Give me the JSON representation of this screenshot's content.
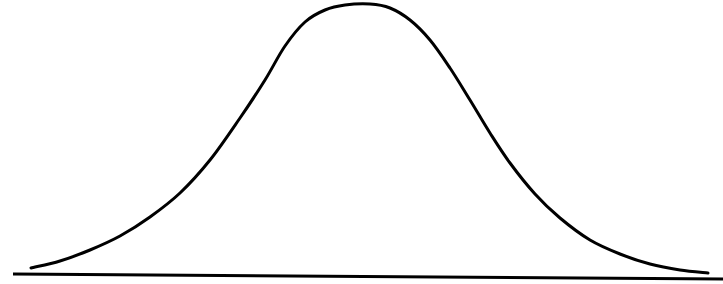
{
  "diagram": {
    "type": "normal-distribution-curve",
    "background": "#ffffff",
    "stroke_color": "#000000",
    "curve": {
      "stroke_width": 3,
      "points": [
        [
          31,
          268
        ],
        [
          60,
          261
        ],
        [
          90,
          250
        ],
        [
          120,
          236
        ],
        [
          150,
          217
        ],
        [
          180,
          193
        ],
        [
          210,
          160
        ],
        [
          240,
          118
        ],
        [
          265,
          80
        ],
        [
          285,
          46
        ],
        [
          305,
          22
        ],
        [
          325,
          10
        ],
        [
          345,
          5
        ],
        [
          370,
          4
        ],
        [
          390,
          8
        ],
        [
          410,
          20
        ],
        [
          430,
          40
        ],
        [
          450,
          68
        ],
        [
          470,
          100
        ],
        [
          490,
          133
        ],
        [
          510,
          163
        ],
        [
          535,
          194
        ],
        [
          560,
          218
        ],
        [
          590,
          240
        ],
        [
          620,
          254
        ],
        [
          650,
          264
        ],
        [
          680,
          270
        ],
        [
          708,
          273
        ]
      ]
    },
    "baseline": {
      "x1": 13,
      "y1": 274,
      "x2": 723,
      "y2": 279,
      "stroke_width": 3
    }
  }
}
